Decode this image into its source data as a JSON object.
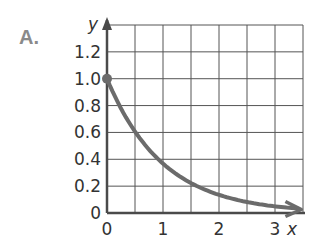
{
  "panel_label": "A.",
  "chart_data": {
    "type": "line",
    "title": "",
    "xlabel": "x",
    "ylabel": "y",
    "xlim": [
      0,
      3.5
    ],
    "ylim": [
      0,
      1.4
    ],
    "grid": true,
    "x_ticks": [
      "0",
      "1",
      "2",
      "3"
    ],
    "y_ticks": [
      "0",
      "0.2",
      "0.4",
      "0.6",
      "0.8",
      "1.0",
      "1.2"
    ],
    "x_grid_step": 0.5,
    "y_grid_step": 0.2,
    "series": [
      {
        "name": "y = e^(-x)",
        "x": [
          0,
          0.25,
          0.5,
          0.75,
          1.0,
          1.25,
          1.5,
          1.75,
          2.0,
          2.5,
          3.0,
          3.4
        ],
        "values": [
          1.0,
          0.78,
          0.61,
          0.47,
          0.37,
          0.29,
          0.22,
          0.17,
          0.14,
          0.08,
          0.05,
          0.03
        ],
        "start_point": [
          0,
          1.0
        ],
        "arrow_end": true
      }
    ],
    "colors": {
      "curve": "#6b6b6b",
      "grid": "#555555",
      "axis": "#4a4a4a"
    }
  }
}
